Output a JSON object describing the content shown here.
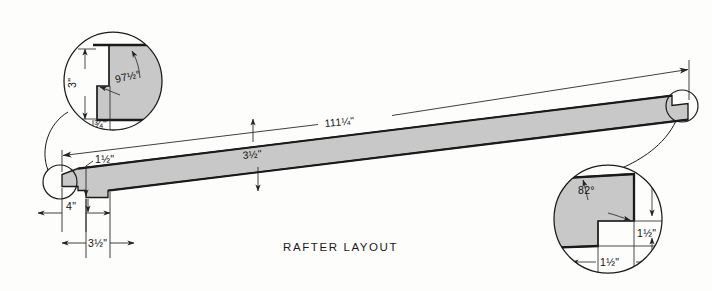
{
  "drawing": {
    "title": "RAFTER LAYOUT",
    "colors": {
      "background": "#fdfdfc",
      "board_fill": "#c8c8c8",
      "outline": "#1a1a1a",
      "dim_line": "#2a2a2a",
      "text": "#111111"
    },
    "main_view": {
      "name": "rafter-board",
      "overall_length_label": "111¼\"",
      "depth_label": "3½\"",
      "seat_cut_label": "1½\"",
      "tail_length_label": "4\"",
      "heel_width_label": "3½\""
    },
    "detail_upper_left": {
      "name": "ridge-cut-detail",
      "angle_label": "97½°",
      "vertical_label": "3\"",
      "horizontal_label": "¾\""
    },
    "detail_lower_right": {
      "name": "birdsmouth-detail",
      "angle_label": "82°",
      "vertical_label": "1½\"",
      "horizontal_label": "1½\""
    }
  }
}
